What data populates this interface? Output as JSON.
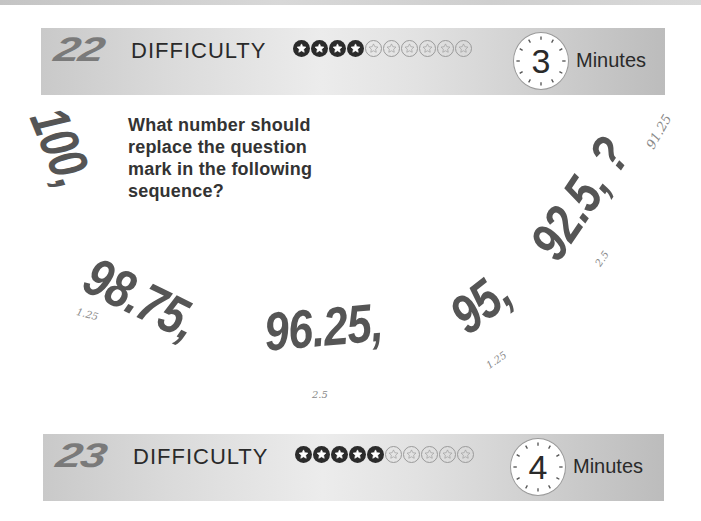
{
  "puzzles": [
    {
      "number": "22",
      "difficulty_label": "DIFFICULTY",
      "difficulty": {
        "filled": 4,
        "total": 10
      },
      "time": "3",
      "time_unit": "Minutes"
    },
    {
      "number": "23",
      "difficulty_label": "DIFFICULTY",
      "difficulty": {
        "filled": 5,
        "total": 10
      },
      "time": "4",
      "time_unit": "Minutes"
    }
  ],
  "question": {
    "text": "What number should replace the question mark in the following sequence?",
    "sequence": [
      "100,",
      "98.75,",
      "96.25,",
      "95,",
      "92.5, ?"
    ]
  },
  "handwritten_notes": {
    "differences": [
      "1.25",
      "2.5",
      "1.25",
      "2.5"
    ],
    "answer": "91.25"
  },
  "colors": {
    "banner_gray": "#d6d6d6",
    "number_gray": "#7a7a7a",
    "sequence_gray": "#555555",
    "text_dark": "#2a2a2a"
  }
}
